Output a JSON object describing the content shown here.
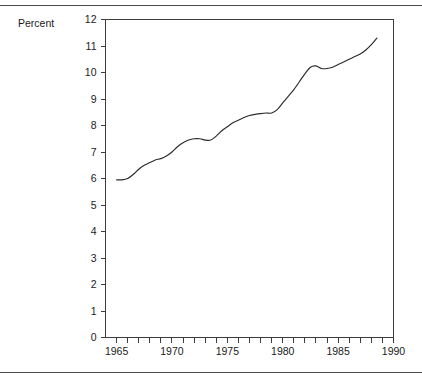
{
  "figure": {
    "has_top_rule": true,
    "has_bottom_rule": true,
    "rule_color": "#4a4a4a",
    "background": "#ffffff",
    "line_color": "#2b2b2b"
  },
  "chart_data": {
    "type": "line",
    "title": "",
    "subtitle": "",
    "ylabel": "Percent",
    "xlabel": "",
    "ylim": [
      0,
      12
    ],
    "xlim": [
      1964,
      1990
    ],
    "grid": false,
    "legend": null,
    "y_ticks": [
      0,
      1,
      2,
      3,
      4,
      5,
      6,
      7,
      8,
      9,
      10,
      11,
      12
    ],
    "y_tick_labels": [
      "0",
      "1",
      "2",
      "3",
      "4",
      "5",
      "6",
      "7",
      "8",
      "9",
      "10",
      "11",
      "12"
    ],
    "x_ticks": [
      1965,
      1966,
      1967,
      1968,
      1969,
      1970,
      1971,
      1972,
      1973,
      1974,
      1975,
      1976,
      1977,
      1978,
      1979,
      1980,
      1981,
      1982,
      1983,
      1984,
      1985,
      1986,
      1987,
      1988,
      1989,
      1990
    ],
    "x_tick_labels": [
      "1965",
      "",
      "",
      "",
      "",
      "1970",
      "",
      "",
      "",
      "",
      "1975",
      "",
      "",
      "",
      "",
      "1980",
      "",
      "",
      "",
      "",
      "1985",
      "",
      "",
      "",
      "",
      "1990"
    ],
    "x_major_labels": [
      "1965",
      "1970",
      "1975",
      "1980",
      "1985",
      "1990"
    ],
    "series": [
      {
        "name": "Percent",
        "x": [
          1965.0,
          1965.5,
          1966.0,
          1966.5,
          1967.0,
          1967.5,
          1968.0,
          1968.5,
          1969.0,
          1969.5,
          1970.0,
          1970.5,
          1971.0,
          1971.5,
          1972.0,
          1972.5,
          1973.0,
          1973.5,
          1974.0,
          1974.5,
          1975.0,
          1975.5,
          1976.0,
          1976.5,
          1977.0,
          1977.5,
          1978.0,
          1978.5,
          1979.0,
          1979.5,
          1980.0,
          1980.5,
          1981.0,
          1981.5,
          1982.0,
          1982.5,
          1983.0,
          1983.5,
          1984.0,
          1984.5,
          1985.0,
          1985.5,
          1986.0,
          1986.5,
          1987.0,
          1987.5,
          1988.0,
          1988.5
        ],
        "y": [
          5.95,
          5.95,
          6.0,
          6.15,
          6.35,
          6.5,
          6.6,
          6.7,
          6.75,
          6.85,
          7.0,
          7.2,
          7.35,
          7.45,
          7.5,
          7.5,
          7.45,
          7.45,
          7.6,
          7.8,
          7.95,
          8.1,
          8.2,
          8.3,
          8.38,
          8.42,
          8.45,
          8.47,
          8.47,
          8.6,
          8.85,
          9.1,
          9.35,
          9.65,
          9.95,
          10.2,
          10.25,
          10.15,
          10.15,
          10.2,
          10.3,
          10.4,
          10.5,
          10.6,
          10.7,
          10.85,
          11.05,
          11.3
        ]
      }
    ],
    "annotations": []
  },
  "axis": {
    "y_title": "Percent"
  }
}
